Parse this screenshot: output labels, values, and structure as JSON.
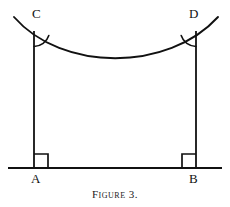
{
  "figure": {
    "caption": "Figure 3.",
    "stroke_color": "#111111",
    "background_color": "#ffffff",
    "labels": {
      "top_left": "C",
      "top_right": "D",
      "bottom_left": "A",
      "bottom_right": "B"
    },
    "geometry": {
      "baseline": {
        "x1": 8,
        "y1": 168,
        "x2": 222,
        "y2": 168
      },
      "left_post": {
        "x1": 34,
        "y1": 31,
        "x2": 34,
        "y2": 168
      },
      "right_post": {
        "x1": 196,
        "y1": 31,
        "x2": 196,
        "y2": 168
      },
      "curve": {
        "start": {
          "x": 14,
          "y": 17
        },
        "control1": {
          "x": 62,
          "y": 72
        },
        "control2": {
          "x": 168,
          "y": 72
        },
        "end": {
          "x": 218,
          "y": 17
        },
        "lowest_point": {
          "x": 115,
          "y": 62
        }
      },
      "right_angle_marker_a": {
        "x": 34,
        "y": 168,
        "size": 14,
        "opens": "right"
      },
      "right_angle_marker_b": {
        "x": 196,
        "y": 168,
        "size": 14,
        "opens": "left"
      },
      "angle_arc_c": {
        "x": 34,
        "y": 31,
        "radius": 15
      },
      "angle_arc_d": {
        "x": 196,
        "y": 31,
        "radius": 15
      }
    }
  }
}
